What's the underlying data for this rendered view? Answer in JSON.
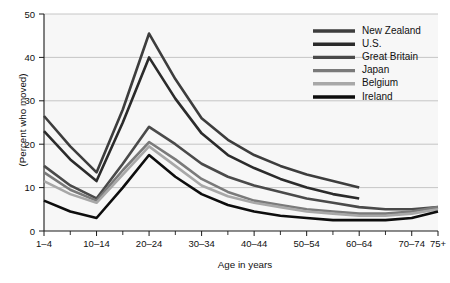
{
  "chart_data": {
    "type": "line",
    "title": "",
    "xlabel": "Age in years",
    "ylabel": "(Percent who moved)",
    "ylim": [
      0,
      50
    ],
    "yticks": [
      0,
      10,
      20,
      30,
      40,
      50
    ],
    "ytick_labels": [
      "0",
      "10",
      "20",
      "30",
      "40",
      "50"
    ],
    "grid": true,
    "grid_axis": "y",
    "legend_position": "top-right",
    "categories": [
      "1–4",
      "5–9",
      "10–14",
      "15–19",
      "20–24",
      "25–29",
      "30–34",
      "35–39",
      "40–44",
      "45–49",
      "50–54",
      "55–59",
      "60–64",
      "65–69",
      "70–74",
      "75+"
    ],
    "xtick_labels_shown": [
      "1–4",
      "10–14",
      "20–24",
      "30–34",
      "40–44",
      "50–54",
      "60–64",
      "70–74",
      "75+"
    ],
    "series": [
      {
        "name": "New Zealand",
        "color": "#3d3d3d",
        "values": [
          26.5,
          19.5,
          13.5,
          28.0,
          45.5,
          35.0,
          26.0,
          21.0,
          17.5,
          15.0,
          13.0,
          11.5,
          10.0,
          null,
          null,
          null
        ]
      },
      {
        "name": "U.S.",
        "color": "#2b2b2b",
        "values": [
          23.0,
          16.5,
          11.5,
          25.0,
          40.0,
          30.5,
          22.5,
          17.5,
          14.5,
          12.0,
          10.0,
          8.5,
          7.5,
          null,
          null,
          null
        ]
      },
      {
        "name": "Great Britain",
        "color": "#4a4a4a",
        "values": [
          15.0,
          10.5,
          7.5,
          15.5,
          24.0,
          20.0,
          15.5,
          12.5,
          10.5,
          9.0,
          7.5,
          6.5,
          5.5,
          5.0,
          5.0,
          5.5
        ]
      },
      {
        "name": "Japan",
        "color": "#7a7a7a",
        "values": [
          13.5,
          9.5,
          7.0,
          14.0,
          20.5,
          16.5,
          12.0,
          9.0,
          7.0,
          6.0,
          5.0,
          4.5,
          4.0,
          4.0,
          4.5,
          5.5
        ]
      },
      {
        "name": "Belgium",
        "color": "#a8a8a8",
        "values": [
          11.5,
          8.5,
          6.5,
          13.0,
          19.5,
          15.0,
          10.5,
          8.0,
          6.5,
          5.5,
          4.5,
          4.0,
          3.5,
          3.5,
          4.0,
          5.0
        ]
      },
      {
        "name": "Ireland",
        "color": "#0d0d0d",
        "values": [
          7.0,
          4.5,
          3.0,
          10.0,
          17.5,
          12.5,
          8.5,
          6.0,
          4.5,
          3.5,
          3.0,
          2.5,
          2.5,
          2.5,
          3.0,
          4.5
        ]
      }
    ]
  },
  "legend": {
    "entries": [
      {
        "label": "New Zealand"
      },
      {
        "label": "U.S."
      },
      {
        "label": "Great Britain"
      },
      {
        "label": "Japan"
      },
      {
        "label": "Belgium"
      },
      {
        "label": "Ireland"
      }
    ]
  }
}
